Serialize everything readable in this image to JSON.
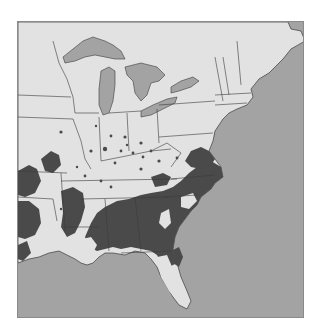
{
  "map": {
    "region": "Eastern United States",
    "legend": [],
    "colors": {
      "land": "#e2e2e2",
      "water": "#a3a3a3",
      "range": "#4a4a4a",
      "border": "#3a3a3a",
      "frame": "#8a8a8a"
    },
    "layers": {
      "water_bodies": [
        "Atlantic Ocean",
        "Gulf of Mexico",
        "Lake Superior",
        "Lake Michigan",
        "Lake Huron",
        "Lake Erie",
        "Lake Ontario"
      ],
      "shaded_range": "Southeastern distribution (dark shading), with scattered outlying spots in the Midwest"
    }
  }
}
